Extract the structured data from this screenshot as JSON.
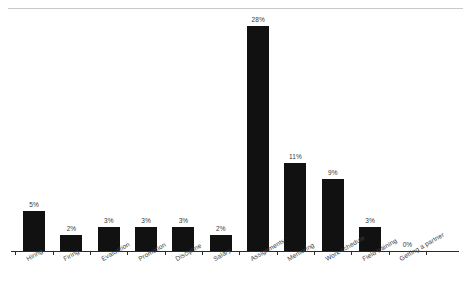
{
  "chart_data": {
    "type": "bar",
    "title": "",
    "subtitle": "",
    "xlabel": "",
    "ylabel": "",
    "ylim": [
      0,
      30
    ],
    "grid": false,
    "legend": false,
    "orientation": "vertical",
    "bar_color": "#111111",
    "background_color": "#ffffff",
    "axis_color": "#2b2b2b",
    "value_label_format": "percent",
    "categories": [
      "Hiring",
      "Firing",
      "Evaluation",
      "Promotion",
      "Discipline",
      "Salary",
      "Assignments",
      "Mentoring",
      "Work schedule",
      "Field training",
      "Getting a partner"
    ],
    "values": [
      5,
      2,
      3,
      3,
      3,
      2,
      28,
      11,
      9,
      3,
      0
    ],
    "value_labels": [
      "5%",
      "2%",
      "3%",
      "3%",
      "3%",
      "2%",
      "28%",
      "11%",
      "9%",
      "3%",
      "0%"
    ]
  }
}
